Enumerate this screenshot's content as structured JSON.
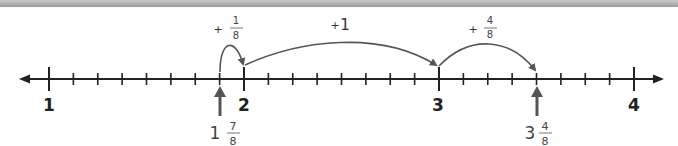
{
  "diagram": {
    "type": "number-line",
    "range": [
      1,
      4
    ],
    "subdivisions_per_unit": 8,
    "major_labels": [
      "1",
      "2",
      "3",
      "4"
    ],
    "hops": [
      {
        "sign": "+",
        "whole": "",
        "numerator": "1",
        "denominator": "8",
        "from": "1 7/8",
        "to": "2"
      },
      {
        "sign": "+",
        "whole": "1",
        "numerator": "",
        "denominator": "",
        "from": "2",
        "to": "3"
      },
      {
        "sign": "+",
        "whole": "",
        "numerator": "4",
        "denominator": "8",
        "from": "3",
        "to": "3 4/8"
      }
    ],
    "markers": [
      {
        "whole": "1",
        "numerator": "7",
        "denominator": "8"
      },
      {
        "whole": "3",
        "numerator": "4",
        "denominator": "8"
      }
    ],
    "colors": {
      "line": "#222222",
      "hop_arc": "#555555",
      "marker_arrow": "#555555",
      "top_bar": "#a8a8a8"
    }
  }
}
